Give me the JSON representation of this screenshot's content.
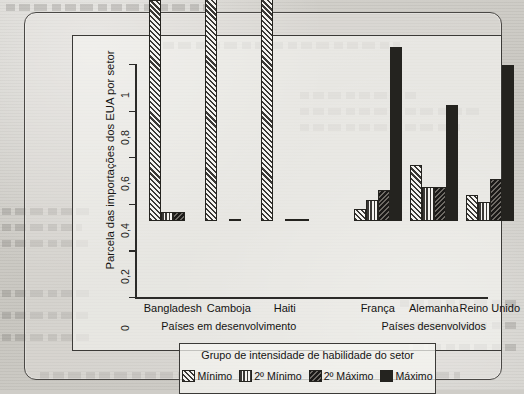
{
  "figure": {
    "y_axis_title": "Parcela das importações dos EUA por setor",
    "y_ticks": [
      "0",
      "0,2",
      "0,4",
      "0,6",
      "0,8",
      "1"
    ],
    "group_labels": [
      "Países em desenvolvimento",
      "Países desenvolvidos"
    ],
    "legend_title": "Grupo de intensidade de habilidade do setor"
  },
  "chart_data": {
    "type": "bar",
    "title": "",
    "xlabel": "",
    "ylabel": "Parcela das importações dos EUA por setor",
    "ylim": [
      0,
      1
    ],
    "ytick_labels": [
      "0",
      "0,2",
      "0,4",
      "0,6",
      "0,8",
      "1"
    ],
    "ytick_values": [
      0,
      0.2,
      0.4,
      0.6,
      0.8,
      1
    ],
    "grid": false,
    "legend_position": "bottom",
    "legend_title": "Grupo de intensidade de habilidade do setor",
    "categories": [
      "Bangladesh",
      "Camboja",
      "Haiti",
      "França",
      "Alemanha",
      "Reino Unido"
    ],
    "category_groups": [
      {
        "label": "Países em desenvolvimento",
        "categories": [
          "Bangladesh",
          "Camboja",
          "Haiti"
        ]
      },
      {
        "label": "Países desenvolvidos",
        "categories": [
          "França",
          "Alemanha",
          "Reino Unido"
        ]
      }
    ],
    "series": [
      {
        "name": "Mínimo",
        "pattern": "diagonal-hatch",
        "values": [
          0.95,
          0.99,
          0.97,
          0.05,
          0.24,
          0.11
        ]
      },
      {
        "name": "2º Mínimo",
        "pattern": "vertical-lines",
        "values": [
          0.04,
          0.0,
          0.0,
          0.09,
          0.145,
          0.08
        ]
      },
      {
        "name": "2º Máximo",
        "pattern": "dark-back-hatch",
        "values": [
          0.04,
          0.01,
          0.01,
          0.135,
          0.145,
          0.18
        ]
      },
      {
        "name": "Máximo",
        "pattern": "solid",
        "values": [
          0.0,
          0.0,
          0.01,
          0.745,
          0.5,
          0.67
        ]
      }
    ]
  }
}
